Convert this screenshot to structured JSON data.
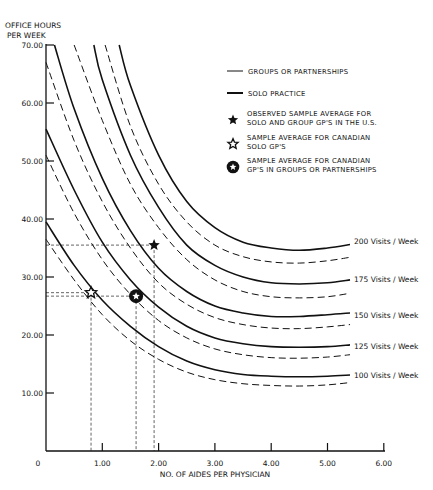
{
  "chart_data": {
    "type": "line",
    "title": "",
    "xlabel": "NO. OF AIDES PER PHYSICIAN",
    "ylabel": "OFFICE HOURS PER WEEK",
    "ylabel_lines": [
      "OFFICE HOURS",
      "PER WEEK"
    ],
    "xlim": [
      0,
      6
    ],
    "ylim": [
      0,
      70
    ],
    "x_ticks": [
      "0",
      "1.00",
      "2.00",
      "3.00",
      "4.00",
      "5.00",
      "6.00"
    ],
    "y_ticks": [
      "10.00",
      "20.00",
      "30.00",
      "40.00",
      "50.00",
      "60.00",
      "70.00"
    ],
    "grid": false,
    "legend": [
      {
        "style": "dashed",
        "label": "GROUPS OR PARTNERSHIPS"
      },
      {
        "style": "solid",
        "label": "SOLO PRACTICE"
      },
      {
        "style": "filled-star",
        "label_lines": [
          "OBSERVED SAMPLE AVERAGE FOR",
          "SOLO AND GROUP GP'S IN THE U.S."
        ]
      },
      {
        "style": "open-star",
        "label_lines": [
          "SAMPLE AVERAGE FOR CANADIAN",
          "SOLO GP'S"
        ]
      },
      {
        "style": "circle-star",
        "label_lines": [
          "SAMPLE AVERAGE FOR CANADIAN",
          "GP'S IN GROUPS OR PARTNERSHIPS"
        ]
      }
    ],
    "series": [
      {
        "name": "100 Visits / Week - Solo",
        "style": "solid",
        "x": [
          0,
          0.5,
          1,
          1.5,
          2,
          2.5,
          3,
          3.5,
          4,
          4.5,
          5,
          5.4
        ],
        "y": [
          39.5,
          32,
          26,
          21.5,
          18,
          15.5,
          14,
          13.2,
          12.9,
          12.8,
          12.9,
          13.1
        ]
      },
      {
        "name": "100 Visits / Week - Group",
        "style": "dashed",
        "x": [
          0,
          0.5,
          1,
          1.5,
          2,
          2.5,
          3,
          3.5,
          4,
          4.5,
          5,
          5.4
        ],
        "y": [
          36.5,
          29.5,
          23.5,
          19,
          15.8,
          13.6,
          12.3,
          11.6,
          11.3,
          11.2,
          11.4,
          11.8
        ]
      },
      {
        "name": "125 Visits / Week - Solo",
        "style": "solid",
        "x": [
          0,
          0.5,
          1,
          1.5,
          2,
          2.5,
          3,
          3.5,
          4,
          4.5,
          5,
          5.4
        ],
        "y": [
          55.5,
          45,
          36,
          29.5,
          24.8,
          21.5,
          19.5,
          18.5,
          18,
          17.9,
          18,
          18.3
        ]
      },
      {
        "name": "125 Visits / Week - Group",
        "style": "dashed",
        "x": [
          0,
          0.5,
          1,
          1.5,
          2,
          2.5,
          3,
          3.5,
          4,
          4.5,
          5,
          5.4
        ],
        "y": [
          51,
          41,
          33,
          27,
          22.5,
          19.5,
          17.6,
          16.6,
          16.1,
          16,
          16.2,
          16.6
        ]
      },
      {
        "name": "150 Visits / Week - Solo",
        "style": "solid",
        "x": [
          0.15,
          0.5,
          1,
          1.5,
          2,
          2.5,
          3,
          3.5,
          4,
          4.5,
          5,
          5.4
        ],
        "y": [
          70,
          59,
          47,
          38,
          31.5,
          27.5,
          25,
          23.8,
          23.2,
          23.2,
          23.5,
          23.8
        ]
      },
      {
        "name": "150 Visits / Week - Group",
        "style": "dashed",
        "x": [
          0,
          0.5,
          1,
          1.5,
          2,
          2.5,
          3,
          3.5,
          4,
          4.5,
          5,
          5.4
        ],
        "y": [
          67,
          53.5,
          43,
          35,
          29,
          25.3,
          23,
          21.8,
          21.2,
          21.1,
          21.4,
          21.8
        ]
      },
      {
        "name": "175 Visits / Week - Solo",
        "style": "solid",
        "x": [
          0.85,
          1,
          1.5,
          2,
          2.5,
          3,
          3.5,
          4,
          4.5,
          5,
          5.4
        ],
        "y": [
          70,
          64,
          51,
          42,
          35.5,
          32,
          30,
          29,
          28.8,
          29,
          29.5
        ]
      },
      {
        "name": "175 Visits / Week - Group",
        "style": "dashed",
        "x": [
          0.5,
          1,
          1.5,
          2,
          2.5,
          3,
          3.5,
          4,
          4.5,
          5,
          5.4
        ],
        "y": [
          70,
          57,
          46,
          38.5,
          33,
          29.5,
          27.5,
          26.6,
          26.4,
          26.6,
          27.2
        ]
      },
      {
        "name": "200 Visits / Week - Solo",
        "style": "solid",
        "x": [
          1.3,
          1.5,
          2,
          2.5,
          3,
          3.5,
          4,
          4.5,
          5,
          5.4
        ],
        "y": [
          70,
          63,
          51,
          43,
          38.5,
          36,
          35,
          34.6,
          35,
          35.6
        ]
      },
      {
        "name": "200 Visits / Week - Group",
        "style": "dashed",
        "x": [
          1.05,
          1.5,
          2,
          2.5,
          3,
          3.5,
          4,
          4.5,
          5,
          5.4
        ],
        "y": [
          70,
          56,
          46,
          39.5,
          35.5,
          33.5,
          32.6,
          32.4,
          32.8,
          33.4
        ]
      }
    ],
    "curve_labels": [
      "200 Visits / Week",
      "175 Visits / Week",
      "150 Visits / Week",
      "125 Visits / Week",
      "100 Visits / Week"
    ],
    "points": [
      {
        "name": "Observed sample average U.S.",
        "marker": "filled-star",
        "x": 1.92,
        "y": 35.5
      },
      {
        "name": "Canadian solo GP's",
        "marker": "open-star",
        "x": 0.8,
        "y": 27.3
      },
      {
        "name": "Canadian groups/partnerships",
        "marker": "circle-star",
        "x": 1.6,
        "y": 26.7
      }
    ]
  }
}
